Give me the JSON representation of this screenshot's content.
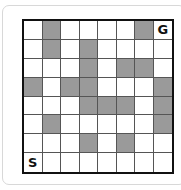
{
  "grid": {
    "rows": 8,
    "cols": 8,
    "shaded_color": "#9a9a9a",
    "cells": [
      [
        "",
        "#",
        "",
        "",
        "",
        "",
        "#",
        "G"
      ],
      [
        "",
        "#",
        "",
        "#",
        "",
        "",
        "",
        ""
      ],
      [
        "",
        "",
        "",
        "#",
        "",
        "#",
        "#",
        ""
      ],
      [
        "#",
        "",
        "#",
        "#",
        "",
        "",
        "",
        "#"
      ],
      [
        "",
        "",
        "",
        "#",
        "#",
        "#",
        "",
        "#"
      ],
      [
        "",
        "#",
        "",
        "",
        "",
        "",
        "",
        "#"
      ],
      [
        "",
        "",
        "",
        "#",
        "",
        "#",
        "",
        ""
      ],
      [
        "S",
        "",
        "",
        "",
        "",
        "",
        "",
        ""
      ]
    ],
    "start_label": "S",
    "goal_label": "G"
  }
}
